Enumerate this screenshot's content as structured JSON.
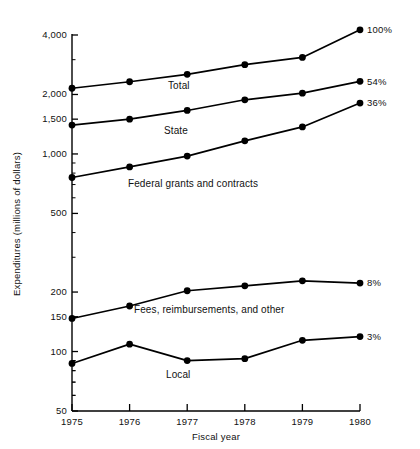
{
  "chart_data": {
    "type": "line",
    "title": "",
    "xlabel": "Fiscal year",
    "ylabel": "Expenditures (millions of dollars)",
    "yscale": "log",
    "ylim": [
      50,
      4500
    ],
    "grid": false,
    "legend": "inline-labels",
    "categories": [
      "1975",
      "1976",
      "1977",
      "1978",
      "1979",
      "1980"
    ],
    "ytick_labels": [
      "4,000",
      "2,000",
      "1,500",
      "1,000",
      "500",
      "200",
      "150",
      "100",
      "50"
    ],
    "ytick_values": [
      4000,
      2000,
      1500,
      1000,
      500,
      200,
      150,
      100,
      50
    ],
    "series": [
      {
        "name": "Total",
        "label": "Total",
        "end_label": "100%",
        "values": [
          2150,
          2320,
          2530,
          2830,
          3080,
          4250
        ]
      },
      {
        "name": "State",
        "label": "State",
        "end_label": "54%",
        "values": [
          1400,
          1500,
          1660,
          1880,
          2030,
          2330
        ]
      },
      {
        "name": "Federal grants and contracts",
        "label": "Federal grants and contracts",
        "end_label": "36%",
        "values": [
          760,
          860,
          975,
          1165,
          1370,
          1810
        ]
      },
      {
        "name": "Fees, reimbursements, and other",
        "label": "Fees, reimbursements, and other",
        "end_label": "8%",
        "values": [
          147,
          170,
          203,
          215,
          228,
          222
        ]
      },
      {
        "name": "Local",
        "label": "Local",
        "end_label": "3%",
        "values": [
          87,
          109,
          90,
          92,
          114,
          119
        ]
      }
    ]
  },
  "labels": {
    "y_axis_title": "Expenditures (millions of dollars)",
    "x_axis_title": "Fiscal year"
  }
}
